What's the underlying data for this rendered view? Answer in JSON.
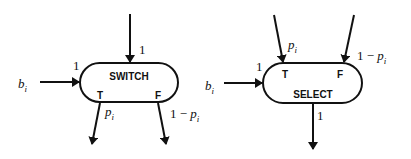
{
  "diagram": {
    "switch": {
      "label": "SWITCH",
      "port_true": "T",
      "port_false": "F",
      "input_top_weight": "1",
      "control_input": {
        "var": "b",
        "sub": "i",
        "weight": "1"
      },
      "output_true": {
        "var": "p",
        "sub": "i"
      },
      "output_false": {
        "prefix": "1 − ",
        "var": "p",
        "sub": "i"
      }
    },
    "select": {
      "label": "SELECT",
      "port_true": "T",
      "port_false": "F",
      "input_true": {
        "var": "p",
        "sub": "i"
      },
      "input_false": {
        "prefix": "1 − ",
        "var": "p",
        "sub": "i"
      },
      "control_input": {
        "var": "b",
        "sub": "i",
        "weight": "1"
      },
      "output_bottom_weight": "1"
    },
    "colors": {
      "stroke": "#111111",
      "background": "#ffffff"
    }
  }
}
